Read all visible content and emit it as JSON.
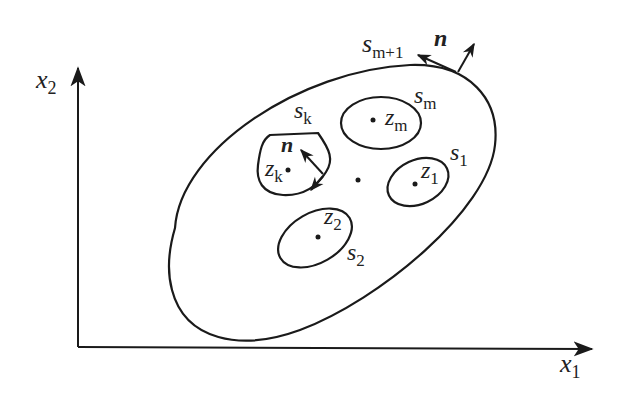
{
  "diagram": {
    "type": "multiply-connected-region",
    "axes": {
      "x_label": "x",
      "x_sub": "1",
      "y_label": "x",
      "y_sub": "2"
    },
    "outer_boundary": {
      "label": "s",
      "sub": "m+1",
      "normal_label": "n"
    },
    "inner_boundaries": [
      {
        "id": "sk",
        "label": "s",
        "sub": "k",
        "point": "z",
        "point_sub": "k",
        "normal_label": "n"
      },
      {
        "id": "sm",
        "label": "s",
        "sub": "m",
        "point": "z",
        "point_sub": "m"
      },
      {
        "id": "s1",
        "label": "s",
        "sub": "1",
        "point": "z",
        "point_sub": "1"
      },
      {
        "id": "s2",
        "label": "s",
        "sub": "2",
        "point": "z",
        "point_sub": "2"
      }
    ],
    "colors": {
      "stroke": "#1a1a1a",
      "background": "#ffffff"
    }
  }
}
